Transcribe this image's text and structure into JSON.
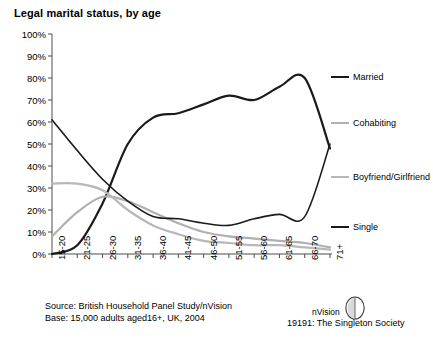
{
  "chart_data": {
    "type": "line",
    "title": "Legal marital status, by age",
    "xlabel": "",
    "ylabel": "",
    "ylim": [
      0,
      100
    ],
    "yticks": [
      "0%",
      "10%",
      "20%",
      "30%",
      "40%",
      "50%",
      "60%",
      "70%",
      "80%",
      "90%",
      "100%"
    ],
    "grid": false,
    "legend_position": "right",
    "categories": [
      "15-20",
      "21-25",
      "26-30",
      "31-35",
      "36-40",
      "41-45",
      "46-50",
      "51-55",
      "56-60",
      "61-65",
      "66-70",
      "71+"
    ],
    "series": [
      {
        "name": "Married",
        "color": "#1a1a1a",
        "width": 2.2,
        "values": [
          0,
          4,
          23,
          50,
          62,
          64,
          68,
          72,
          70,
          76,
          80,
          80
        ]
      },
      {
        "name": "Cohabiting",
        "color": "#b0b0b0",
        "width": 2.2,
        "values": [
          8,
          19,
          26,
          24,
          19,
          14,
          10,
          8,
          7,
          6,
          5,
          3
        ]
      },
      {
        "name": "Boyfriend/Girlfriend",
        "color": "#b8b8b8",
        "width": 2.2,
        "values": [
          32,
          32,
          29,
          20,
          13,
          9,
          6,
          5,
          4,
          4,
          3,
          2
        ]
      },
      {
        "name": "Single",
        "color": "#1a1a1a",
        "width": 1.6,
        "values": [
          61,
          47,
          34,
          24,
          17,
          16,
          14,
          13,
          16,
          18,
          17,
          14
        ]
      }
    ],
    "series_tail": {
      "note": "Married falls and Single rises sharply at the final band where the two lines cross",
      "married_final": 48,
      "single_final": 50
    },
    "annotations": []
  },
  "legend": [
    {
      "label": "Married",
      "color": "#1a1a1a",
      "width": "2.4px"
    },
    {
      "label": "Cohabiting",
      "color": "#b0b0b0",
      "width": "2.2px"
    },
    {
      "label": "Boyfriend/Girlfriend",
      "color": "#b8b8b8",
      "width": "2.2px"
    },
    {
      "label": "Single",
      "color": "#1a1a1a",
      "width": "2.4px"
    }
  ],
  "footer": {
    "source": "Source: British Household Panel Study/nVision",
    "base": "Base: 15,000 adults aged16+, UK, 2004",
    "brand_name": "nVision",
    "brand_caption": "19191: The Singleton Society"
  }
}
